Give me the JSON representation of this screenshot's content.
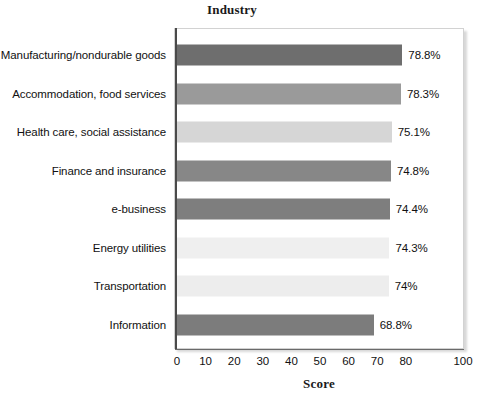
{
  "chart_data": {
    "type": "bar",
    "orientation": "horizontal",
    "title": "Industry",
    "xlabel": "Score",
    "ylabel": "",
    "xlim": [
      0,
      100
    ],
    "grid": false,
    "legend": null,
    "categories": [
      "Manufacturing/nondurable goods",
      "Accommodation, food services",
      "Health care, social assistance",
      "Finance and insurance",
      "e-business",
      "Energy utilities",
      "Transportation",
      "Information"
    ],
    "values": [
      78.8,
      78.3,
      75.1,
      74.8,
      74.4,
      74.3,
      74.0,
      68.8
    ],
    "value_labels": [
      "78.8%",
      "78.3%",
      "75.1%",
      "74.8%",
      "74.4%",
      "74.3%",
      "74%",
      "68.8%"
    ],
    "bar_colors": [
      "#6e6e6e",
      "#9a9a9a",
      "#d6d6d6",
      "#878787",
      "#7e7e7e",
      "#efefef",
      "#ededed",
      "#7c7c7c"
    ],
    "xticks": [
      0,
      10,
      20,
      30,
      40,
      50,
      60,
      70,
      80,
      90,
      100
    ],
    "xtick_labels": [
      "0",
      "10",
      "20",
      "30",
      "40",
      "50",
      "60",
      "70",
      "80",
      "",
      "100"
    ]
  },
  "axis": {
    "spine_color": "#4a4a4a",
    "frame_color": "#d2d2d2"
  }
}
